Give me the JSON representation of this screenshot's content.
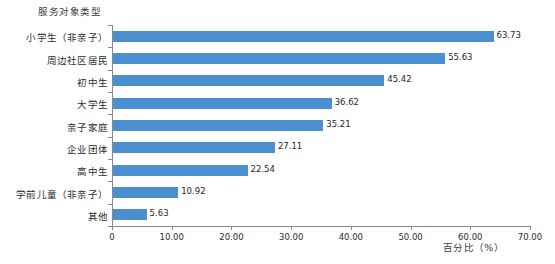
{
  "chart_data": {
    "type": "bar",
    "orientation": "horizontal",
    "title": "",
    "ylabel": "服务对象类型",
    "xlabel": "百分比（%）",
    "xlim": [
      0,
      70
    ],
    "xticks": [
      0,
      10,
      20,
      30,
      40,
      50,
      60,
      70
    ],
    "xtick_labels": [
      "0",
      "10.00",
      "20.00",
      "30.00",
      "40.00",
      "50.00",
      "60.00",
      "70.00"
    ],
    "grid": false,
    "legend": "none",
    "series_color": "#4A8FD0",
    "categories": [
      "小学生（非亲子）",
      "周边社区居民",
      "初中生",
      "大学生",
      "亲子家庭",
      "企业团体",
      "高中生",
      "学前儿童（非亲子）",
      "其他"
    ],
    "values": [
      63.73,
      55.63,
      45.42,
      36.62,
      35.21,
      27.11,
      22.54,
      10.92,
      5.63
    ],
    "value_labels": [
      "63.73",
      "55.63",
      "45.42",
      "36.62",
      "35.21",
      "27.11",
      "22.54",
      "10.92",
      "5.63"
    ]
  }
}
